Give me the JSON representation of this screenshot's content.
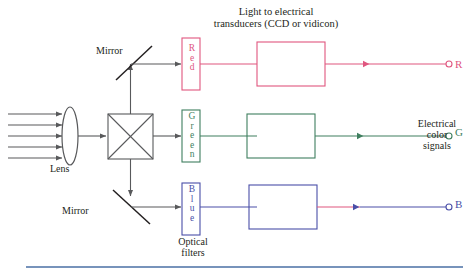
{
  "figure": {
    "title_line1": "Light to electrical",
    "title_line2": "transducers (CCD or vidicon)",
    "bottom_rule_color": "#4a6fa5"
  },
  "labels": {
    "mirror_top": "Mirror",
    "mirror_bottom": "Mirror",
    "lens": "Lens",
    "optical_line1": "Optical",
    "optical_line2": "filters",
    "electrical_line1": "Electrical",
    "electrical_line2": "color",
    "electrical_line3": "signals"
  },
  "filters": [
    {
      "name": "red-filter",
      "text": "Red",
      "letters": [
        "R",
        "e",
        "d"
      ],
      "color": "#e0567f"
    },
    {
      "name": "green-filter",
      "text": "Green",
      "letters": [
        "G",
        "r",
        "e",
        "e",
        "n"
      ],
      "color": "#3f7f5f"
    },
    {
      "name": "blue-filter",
      "text": "Blue",
      "letters": [
        "B",
        "l",
        "u",
        "e"
      ],
      "color": "#4a4fa8"
    }
  ],
  "outputs": [
    {
      "name": "r-output",
      "label": "R",
      "color": "#e0567f"
    },
    {
      "name": "g-output",
      "label": "G",
      "color": "#3f7f5f"
    },
    {
      "name": "b-output",
      "label": "B",
      "color": "#4a4fa8"
    }
  ],
  "colors": {
    "optics_stroke": "#58595b",
    "red": "#e0567f",
    "green": "#3f7f5f",
    "blue": "#4a4fa8",
    "blue_trace_pink": "#e0567f",
    "text": "#231f20",
    "rule": "#4a6fa5"
  },
  "incoming_rays": {
    "name": "incoming-light-rays",
    "count": 5
  }
}
